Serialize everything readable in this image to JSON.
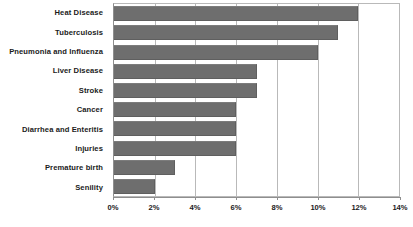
{
  "chart_data": {
    "type": "bar",
    "orientation": "horizontal",
    "title": "",
    "subtitle": "",
    "xlabel": "",
    "ylabel": "",
    "xlim": [
      0,
      14
    ],
    "ylim": null,
    "grid": true,
    "legend": null,
    "legend_position": "none",
    "x_tick_labels": [
      "0%",
      "2%",
      "4%",
      "6%",
      "8%",
      "10%",
      "12%",
      "14%"
    ],
    "x_tick_values": [
      0,
      2,
      4,
      6,
      8,
      10,
      12,
      14
    ],
    "x_unit": "%",
    "categories": [
      "Heat Disease",
      "Tuberculosis",
      "Pneumonia and Influenza",
      "Liver Disease",
      "Stroke",
      "Cancer",
      "Diarrhea and Enteritis",
      "Injuries",
      "Premature birth",
      "Senility"
    ],
    "values": [
      12,
      11,
      10,
      7,
      7,
      6,
      6,
      6,
      3,
      2
    ],
    "bar_color": "#6e6e6e",
    "grid_color": "#b9b9b9",
    "axis_color": "#8e8e8e",
    "text_color": "#1b1b1b",
    "background_color": "#ffffff"
  }
}
